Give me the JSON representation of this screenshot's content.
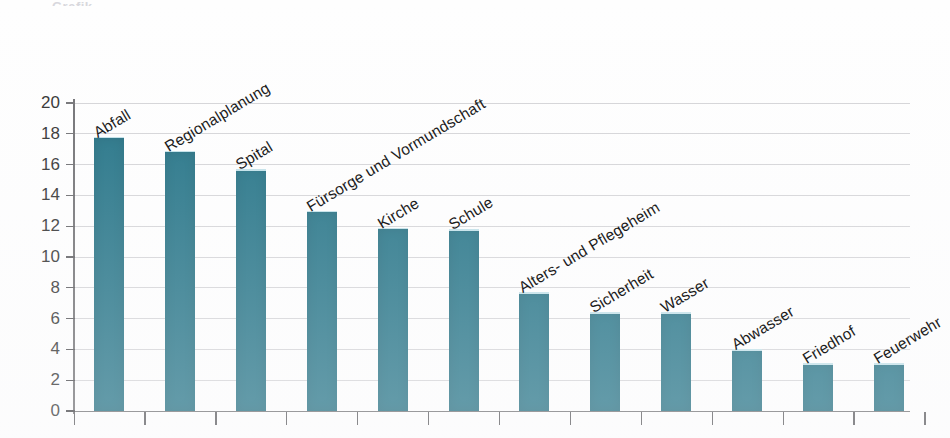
{
  "chart_data": {
    "type": "bar",
    "title": "",
    "xlabel": "",
    "ylabel": "",
    "ylim": [
      0,
      20
    ],
    "ytick_step": 2,
    "yticks": [
      "0",
      "2",
      "4",
      "6",
      "8",
      "10",
      "12",
      "14",
      "16",
      "18",
      "20"
    ],
    "grid": true,
    "legend": "none",
    "bar_color": "#1c6e82",
    "gridline_color": "#d3d3d6",
    "axis_color": "#6d6d70",
    "categories": [
      "Abfall",
      "Regionalplanung",
      "Spital",
      "Fürsorge und Vormundschaft",
      "Kirche",
      "Schule",
      "Alters- und Pflegeheim",
      "Sicherheit",
      "Wasser",
      "Abwasser",
      "Friedhof",
      "Feuerwehr"
    ],
    "values": [
      17.8,
      16.9,
      15.7,
      13.0,
      11.9,
      11.8,
      7.7,
      6.4,
      6.4,
      4.0,
      3.1,
      3.1
    ]
  },
  "artifacts": {
    "top_cut_text": "Grafik"
  }
}
